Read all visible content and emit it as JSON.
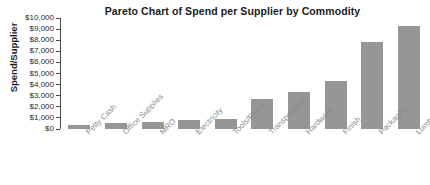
{
  "chart_data": {
    "type": "bar",
    "title": "Pareto Chart of Spend per Supplier by Commodity",
    "xlabel": "",
    "ylabel": "Spend/Supplier",
    "categories": [
      "Petty Cash",
      "Office Supplies",
      "MRO",
      "Electricity",
      "Tools/Equip",
      "Transportation",
      "Hardware",
      "Finish",
      "Packaging",
      "Lumber"
    ],
    "values": [
      400,
      500,
      600,
      800,
      900,
      2700,
      3300,
      4300,
      7800,
      9300
    ],
    "ylim": [
      0,
      10000
    ],
    "ytick_values": [
      0,
      1000,
      2000,
      3000,
      4000,
      5000,
      6000,
      7000,
      8000,
      9000,
      10000
    ],
    "ytick_labels": [
      "$0",
      "$1,000",
      "$2,000",
      "$3,000",
      "$4,000",
      "$5,000",
      "$6,000",
      "$7,000",
      "$8,000",
      "$9,000",
      "$10,000"
    ],
    "grid": false,
    "legend": false,
    "bar_color": "#969696",
    "axis_color": "#4a4a4a",
    "title_color": "#1b1b1b",
    "xtick_label_color": "#8c8c8c"
  }
}
